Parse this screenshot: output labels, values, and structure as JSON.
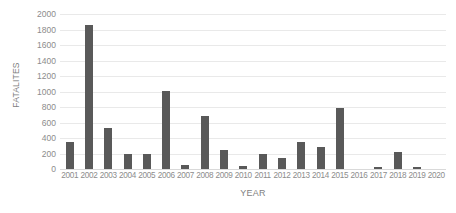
{
  "chart_data": {
    "type": "bar",
    "title": "",
    "subtitle": "",
    "xlabel": "YEAR",
    "ylabel": "FATALITES",
    "categories": [
      "2001",
      "2002",
      "2003",
      "2004",
      "2005",
      "2006",
      "2007",
      "2008",
      "2009",
      "2010",
      "2011",
      "2012",
      "2013",
      "2014",
      "2015",
      "2016",
      "2017",
      "2018",
      "2019",
      "2020"
    ],
    "values": [
      350,
      1860,
      530,
      200,
      195,
      1010,
      50,
      680,
      240,
      40,
      195,
      145,
      350,
      290,
      785,
      0,
      30,
      215,
      20,
      0
    ],
    "series": [
      {
        "name": "Fatalities",
        "values": [
          350,
          1860,
          530,
          200,
          195,
          1010,
          50,
          680,
          240,
          40,
          195,
          145,
          350,
          290,
          785,
          0,
          30,
          215,
          20,
          0
        ]
      }
    ],
    "ylim": [
      0,
      2000
    ],
    "ytick_labels": [
      "2000",
      "1800",
      "1600",
      "1400",
      "1200",
      "1000",
      "800",
      "600",
      "400",
      "200",
      "0"
    ],
    "ytick_values": [
      2000,
      1800,
      1600,
      1400,
      1200,
      1000,
      800,
      600,
      400,
      200,
      0
    ],
    "ytick_interval": 200,
    "grid": "horizontal",
    "legend": "none",
    "annotations": [],
    "colors": {
      "bar": "#595959",
      "gridline": "#e9e9e9",
      "axis_line": "#d9d9d9",
      "tick_label": "#8c8c8c",
      "axis_title": "#7f7f7f",
      "background": "#ffffff"
    }
  }
}
